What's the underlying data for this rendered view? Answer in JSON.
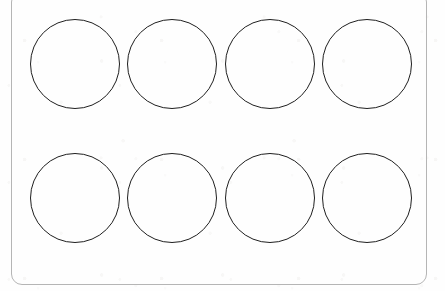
{
  "document": {
    "kind": "printable-template-sheet",
    "title": "Blank Circle Template Sheet",
    "background_color": "#fefefe",
    "sheet_border_color": "#b5b5b5",
    "circle_stroke_color": "#1f1f1f",
    "circle_fill": "none"
  },
  "sheet": {
    "left": 11,
    "top": -8,
    "width": 416,
    "height": 293,
    "corner_radius": 10,
    "border_width": 1
  },
  "grid": {
    "rows": 2,
    "columns": 4,
    "total_circles": 8,
    "circle_diameter": 90,
    "stroke_width": 1.5,
    "row_centers_y": [
      64,
      198
    ],
    "column_centers_x": [
      75,
      172,
      270,
      367
    ]
  },
  "circles": [
    {
      "id": "circle-r1-c1",
      "row": 1,
      "column": 1,
      "cx": 75,
      "cy": 64,
      "d": 90,
      "label": ""
    },
    {
      "id": "circle-r1-c2",
      "row": 1,
      "column": 2,
      "cx": 172,
      "cy": 64,
      "d": 90,
      "label": ""
    },
    {
      "id": "circle-r1-c3",
      "row": 1,
      "column": 3,
      "cx": 270,
      "cy": 64,
      "d": 90,
      "label": ""
    },
    {
      "id": "circle-r1-c4",
      "row": 1,
      "column": 4,
      "cx": 367,
      "cy": 64,
      "d": 90,
      "label": ""
    },
    {
      "id": "circle-r2-c1",
      "row": 2,
      "column": 1,
      "cx": 75,
      "cy": 198,
      "d": 90,
      "label": ""
    },
    {
      "id": "circle-r2-c2",
      "row": 2,
      "column": 2,
      "cx": 172,
      "cy": 198,
      "d": 90,
      "label": ""
    },
    {
      "id": "circle-r2-c3",
      "row": 2,
      "column": 3,
      "cx": 270,
      "cy": 198,
      "d": 90,
      "label": ""
    },
    {
      "id": "circle-r2-c4",
      "row": 2,
      "column": 4,
      "cx": 367,
      "cy": 198,
      "d": 90,
      "label": ""
    }
  ]
}
